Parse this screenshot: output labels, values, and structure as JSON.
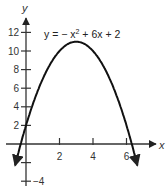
{
  "chart_data": {
    "type": "line",
    "title": "",
    "equation": "y = −x² + 6x + 2",
    "equation_parts": {
      "a": "y = − x",
      "sup": "2",
      "b": " + 6x + 2"
    },
    "xlabel": "x",
    "ylabel": "y",
    "x_ticks": [
      2,
      4,
      6
    ],
    "x_tick_labels": [
      "2",
      "4",
      "6"
    ],
    "y_ticks": [
      -4,
      -2,
      2,
      4,
      6,
      8,
      10,
      12
    ],
    "y_tick_labels": [
      "−4",
      "",
      "2",
      "4",
      "6",
      "8",
      "10",
      "12"
    ],
    "xlim": [
      -0.6,
      7.7
    ],
    "ylim": [
      -4.2,
      13.5
    ],
    "grid": false,
    "series": [
      {
        "name": "y = -x^2 + 6x + 2",
        "function": "-x^2+6x+2",
        "x": [
          -0.6,
          0,
          1,
          2,
          3,
          4,
          5,
          6,
          6.6
        ],
        "values": [
          -1.96,
          2,
          7,
          10,
          11,
          10,
          7,
          2,
          -2.0
        ]
      }
    ],
    "vertex": [
      3,
      11
    ],
    "color": "#111111"
  }
}
